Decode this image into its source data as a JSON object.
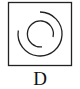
{
  "figure": {
    "label": "D",
    "frame": "square",
    "elements": [
      {
        "type": "arc",
        "name": "outer-arc",
        "radius": "large",
        "gap": "upper-left"
      },
      {
        "type": "arc",
        "name": "inner-arc",
        "radius": "small",
        "gap": "lower-right"
      }
    ],
    "stroke_color": "#222222"
  }
}
